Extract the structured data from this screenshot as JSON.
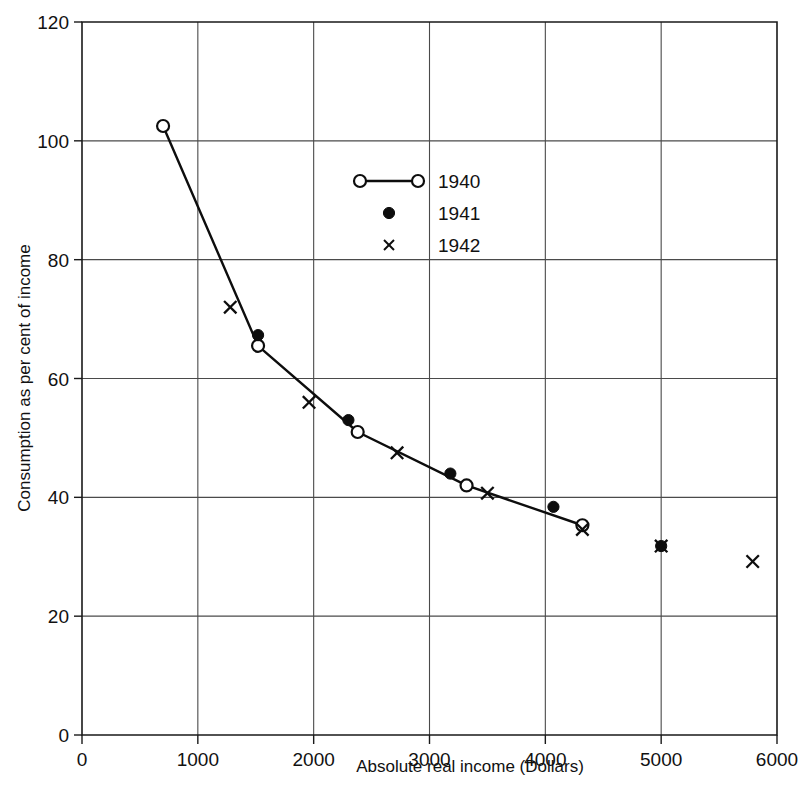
{
  "chart_data": {
    "type": "scatter",
    "title": "",
    "xlabel": "Absolute real income (Dollars)",
    "ylabel": "Consumption as per cent of income",
    "xlim": [
      0,
      6000
    ],
    "ylim": [
      0,
      120
    ],
    "xticks": [
      0,
      1000,
      2000,
      3000,
      4000,
      5000,
      6000
    ],
    "yticks": [
      0,
      20,
      40,
      60,
      80,
      100,
      120
    ],
    "xtick_labels": [
      "0",
      "1000",
      "2000",
      "3000",
      "4000",
      "5000",
      "6000"
    ],
    "ytick_labels": [
      "0",
      "20",
      "40",
      "60",
      "80",
      "100",
      "120"
    ],
    "grid": true,
    "legend_position": "upper center",
    "series": [
      {
        "name": "1940",
        "marker": "open-circle",
        "line": true,
        "points": [
          {
            "x": 700,
            "y": 102.5
          },
          {
            "x": 1520,
            "y": 65.5
          },
          {
            "x": 2380,
            "y": 51.0
          },
          {
            "x": 3320,
            "y": 42.0
          },
          {
            "x": 4320,
            "y": 35.3
          }
        ]
      },
      {
        "name": "1941",
        "marker": "filled-circle",
        "line": false,
        "points": [
          {
            "x": 1520,
            "y": 67.3
          },
          {
            "x": 2300,
            "y": 53.0
          },
          {
            "x": 3180,
            "y": 44.0
          },
          {
            "x": 4070,
            "y": 38.4
          },
          {
            "x": 5000,
            "y": 31.8
          }
        ]
      },
      {
        "name": "1942",
        "marker": "cross",
        "line": false,
        "points": [
          {
            "x": 1280,
            "y": 72.0
          },
          {
            "x": 1960,
            "y": 56.0
          },
          {
            "x": 2720,
            "y": 47.5
          },
          {
            "x": 3500,
            "y": 40.7
          },
          {
            "x": 4320,
            "y": 34.6
          },
          {
            "x": 5000,
            "y": 31.8
          },
          {
            "x": 5790,
            "y": 29.2
          }
        ]
      }
    ],
    "legend": [
      {
        "label": "1940",
        "marker": "open-circle",
        "line": true
      },
      {
        "label": "1941",
        "marker": "filled-circle",
        "line": false
      },
      {
        "label": "1942",
        "marker": "cross",
        "line": false
      }
    ]
  },
  "colors": {
    "ink": "#0d0d0d",
    "grid": "#4a4a4a",
    "background": "#ffffff"
  }
}
